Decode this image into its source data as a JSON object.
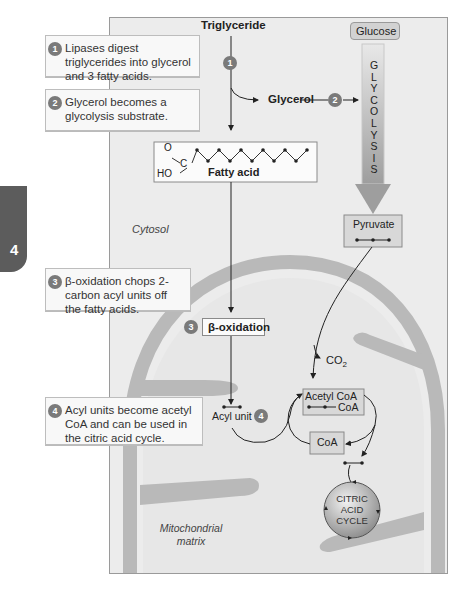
{
  "side_tab": {
    "label": "4"
  },
  "callouts": [
    {
      "num": "1",
      "text": "Lipases digest triglycerides into glycerol and 3 fatty acids."
    },
    {
      "num": "2",
      "text": "Glycerol becomes a glycolysis substrate."
    },
    {
      "num": "3",
      "text": "β-oxidation chops 2-carbon acyl units off the fatty acids."
    },
    {
      "num": "4",
      "text": "Acyl units become acetyl CoA and can be used in the citric acid cycle."
    }
  ],
  "diagram": {
    "triglyceride": "Triglyceride",
    "glucose": "Glucose",
    "glycerol": "Glycerol",
    "glycolysis_letters": [
      "G",
      "L",
      "Y",
      "C",
      "O",
      "L",
      "Y",
      "S",
      "I",
      "S"
    ],
    "fatty_acid": {
      "label": "Fatty acid",
      "O": "O",
      "C": "C",
      "HO": "HO"
    },
    "cytosol": "Cytosol",
    "pyruvate": "Pyruvate",
    "beta_oxidation": "β-oxidation",
    "co2": "CO",
    "co2_sub": "2",
    "acetyl_coa": "Acetyl CoA",
    "acetyl_coa_sub": "CoA",
    "acyl_unit": "Acyl unit",
    "coa": "CoA",
    "citric_acid_cycle": [
      "CITRIC",
      "ACID",
      "CYCLE"
    ],
    "mito_matrix": [
      "Mitochondrial",
      "matrix"
    ],
    "step_markers": [
      "1",
      "2",
      "3",
      "4"
    ]
  },
  "colors": {
    "panel_bg": "#ececec",
    "membrane": "#b9b9b9",
    "badge": "#7a7a7a",
    "arrow_gray": "#a8a8a8",
    "box_fill": "#d8d8d8"
  }
}
